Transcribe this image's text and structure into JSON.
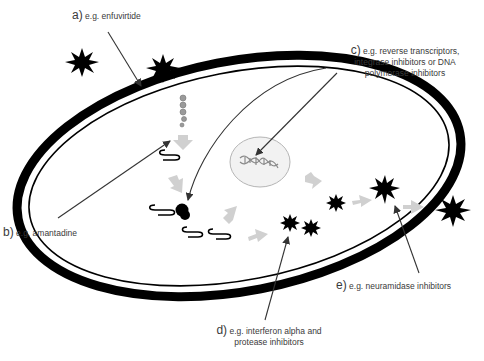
{
  "labels": {
    "a": {
      "letter": "a)",
      "text": "e.g. enfuvirtide"
    },
    "b": {
      "letter": "b)",
      "text": "e.g. amantadine"
    },
    "c": {
      "letter": "c)",
      "line1": "e.g. reverse transcriptors,",
      "line2": "integrase inhibitors or DNA",
      "line3": "polymerase inhibitors"
    },
    "d": {
      "letter": "d)",
      "line1": "e.g. interferon alpha and",
      "line2": "protease inhibitors"
    },
    "e": {
      "letter": "e)",
      "text": "e.g. neuramidase inhibitors"
    }
  },
  "colors": {
    "membrane": "#000000",
    "arrow_pointer": "#333333",
    "flow_arrow": "#d0d0d0",
    "nucleus_fill": "#f2f2f2",
    "nucleus_stroke": "#b5b5b5",
    "dna": "#8a8a8a"
  },
  "elements": {
    "virus_particles": [
      "free-virus-outside-left",
      "virus-attaching",
      "new-virion-inside-1",
      "new-virion-inside-2",
      "new-virion-inside-3",
      "virus-budding",
      "released-virus-right"
    ],
    "cell": "host-cell",
    "nucleus": "nucleus-with-dna",
    "ribosome": "ribosome-with-mrna"
  }
}
